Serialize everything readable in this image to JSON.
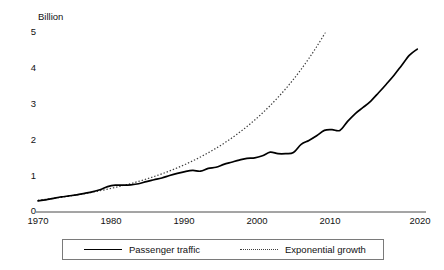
{
  "chart_data": {
    "type": "line",
    "title": "",
    "subtitle": "",
    "xlabel": "",
    "ylabel": "Billion",
    "unit_label": "Billion",
    "xlim": [
      1970,
      2020
    ],
    "ylim": [
      0,
      5
    ],
    "grid": false,
    "legend_position": "bottom",
    "x_tick_labels": [
      "1970",
      "1980",
      "1990",
      "2000",
      "2010",
      "2020"
    ],
    "x_ticks": [
      1970,
      1980,
      1990,
      2000,
      2010,
      2020
    ],
    "y_tick_labels": [
      "0",
      "1",
      "2",
      "3",
      "4",
      "5"
    ],
    "y_ticks": [
      0,
      1,
      2,
      3,
      4,
      5
    ],
    "x": [
      1970,
      1971,
      1972,
      1973,
      1974,
      1975,
      1976,
      1977,
      1978,
      1979,
      1980,
      1981,
      1982,
      1983,
      1984,
      1985,
      1986,
      1987,
      1988,
      1989,
      1990,
      1991,
      1992,
      1993,
      1994,
      1995,
      1996,
      1997,
      1998,
      1999,
      2000,
      2001,
      2002,
      2003,
      2004,
      2005,
      2006,
      2007,
      2008,
      2009,
      2010,
      2011,
      2012,
      2013,
      2014,
      2015,
      2016,
      2017,
      2018,
      2019
    ],
    "series": [
      {
        "name": "Passenger traffic",
        "style": "solid",
        "color": "#000000",
        "values": [
          0.31,
          0.34,
          0.38,
          0.42,
          0.45,
          0.48,
          0.52,
          0.56,
          0.62,
          0.71,
          0.75,
          0.75,
          0.76,
          0.79,
          0.85,
          0.9,
          0.95,
          1.02,
          1.08,
          1.13,
          1.16,
          1.14,
          1.22,
          1.25,
          1.33,
          1.39,
          1.45,
          1.5,
          1.51,
          1.57,
          1.67,
          1.63,
          1.63,
          1.66,
          1.89,
          2.0,
          2.13,
          2.28,
          2.3,
          2.28,
          2.53,
          2.75,
          2.92,
          3.1,
          3.33,
          3.57,
          3.82,
          4.1,
          4.38,
          4.55
        ]
      },
      {
        "name": "Exponential growth",
        "style": "dotted",
        "color": "#3d3d3d",
        "values": [
          0.33,
          0.355,
          0.382,
          0.411,
          0.442,
          0.476,
          0.512,
          0.551,
          0.593,
          0.638,
          0.687,
          0.739,
          0.795,
          0.856,
          0.921,
          0.991,
          1.066,
          1.147,
          1.234,
          1.328,
          1.429,
          1.538,
          1.655,
          1.781,
          1.916,
          2.062,
          2.218,
          2.387,
          2.569,
          2.764,
          2.974,
          3.2,
          3.443,
          3.705,
          3.987,
          4.29,
          4.616,
          4.967,
          5.345,
          5.751,
          6.188,
          6.658,
          7.164,
          7.709,
          8.295,
          8.925,
          9.603,
          10.333,
          11.118,
          11.963
        ]
      }
    ]
  },
  "legend": {
    "items": [
      {
        "label": "Passenger traffic",
        "style": "solid"
      },
      {
        "label": "Exponential growth",
        "style": "dotted"
      }
    ]
  },
  "axes": {
    "unit": "Billion",
    "y_labels": [
      "5",
      "4",
      "3",
      "2",
      "1",
      "0"
    ],
    "x_labels": [
      "1970",
      "1980",
      "1990",
      "2000",
      "2010",
      "2020"
    ]
  }
}
